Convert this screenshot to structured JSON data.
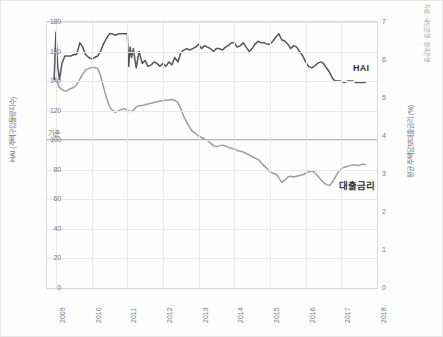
{
  "chart_data": {
    "type": "line",
    "title": "",
    "xlabel": "",
    "ylabel": "HAI (주택구입물량지수)",
    "ylabel_right": "평균 주택담보대출금리 (%)",
    "source_note": "자료 : 국민은행 · 한국은행",
    "grid": true,
    "legend_position": "inline-annotation",
    "xlim": [
      2008.75,
      2018.0
    ],
    "ylim": [
      0,
      180
    ],
    "ylim_right": [
      0,
      7
    ],
    "xticks": [
      "2009",
      "2010",
      "2011",
      "2012",
      "2013",
      "2014",
      "2015",
      "2016",
      "2017",
      "2018"
    ],
    "yticks_left": [
      "0",
      "20",
      "40",
      "60",
      "80",
      "100",
      "120",
      "140",
      "160",
      "180"
    ],
    "yticks_right": [
      "0",
      "1",
      "2",
      "3",
      "4",
      "5",
      "6",
      "7"
    ],
    "baseline": {
      "label": "기준",
      "value_left": 100,
      "value_right": 3.95,
      "color": "#6f6f6f"
    },
    "series": [
      {
        "name": "HAI",
        "axis": "left",
        "color": "#555555",
        "label": "HAI",
        "x": [
          2008.95,
          2009.0,
          2009.05,
          2009.1,
          2009.17,
          2009.25,
          2009.33,
          2009.42,
          2009.5,
          2009.58,
          2009.67,
          2009.75,
          2009.83,
          2009.92,
          2010.0,
          2010.08,
          2010.17,
          2010.25,
          2010.33,
          2010.42,
          2010.5,
          2010.58,
          2010.67,
          2010.75,
          2010.83,
          2010.92,
          2011.0,
          2011.04,
          2011.08,
          2011.12,
          2011.17,
          2011.25,
          2011.33,
          2011.42,
          2011.5,
          2011.58,
          2011.67,
          2011.75,
          2011.83,
          2011.92,
          2012.0,
          2012.08,
          2012.17,
          2012.25,
          2012.33,
          2012.42,
          2012.5,
          2012.58,
          2012.67,
          2012.75,
          2012.83,
          2012.92,
          2013.0,
          2013.08,
          2013.17,
          2013.25,
          2013.33,
          2013.42,
          2013.5,
          2013.58,
          2013.67,
          2013.75,
          2013.83,
          2013.92,
          2014.0,
          2014.08,
          2014.17,
          2014.25,
          2014.33,
          2014.42,
          2014.5,
          2014.58,
          2014.67,
          2014.75,
          2014.83,
          2014.92,
          2015.0,
          2015.08,
          2015.17,
          2015.25,
          2015.33,
          2015.42,
          2015.5,
          2015.58,
          2015.67,
          2015.75,
          2015.83,
          2015.92,
          2016.0,
          2016.08,
          2016.17,
          2016.25,
          2016.33,
          2016.42,
          2016.5,
          2016.58,
          2016.67,
          2016.75,
          2016.83,
          2016.92,
          2017.0,
          2017.08,
          2017.17,
          2017.25,
          2017.33,
          2017.42,
          2017.5,
          2017.58,
          2017.67
        ],
        "values": [
          141,
          173,
          150,
          141,
          152,
          157,
          157,
          157,
          158,
          158,
          166,
          163,
          158,
          156,
          155,
          156,
          157,
          160,
          165,
          169,
          172,
          172,
          171,
          172,
          172,
          172,
          172,
          150,
          163,
          156,
          162,
          149,
          160,
          152,
          154,
          150,
          151,
          153,
          152,
          150,
          152,
          150,
          153,
          151,
          156,
          153,
          159,
          161,
          162,
          161,
          162,
          163,
          165,
          162,
          164,
          163,
          162,
          160,
          162,
          162,
          161,
          163,
          164,
          166,
          166,
          163,
          164,
          166,
          163,
          160,
          162,
          165,
          167,
          166,
          166,
          165,
          165,
          167,
          170,
          172,
          168,
          167,
          165,
          162,
          164,
          163,
          160,
          157,
          153,
          150,
          149,
          150,
          152,
          153,
          152,
          149,
          146,
          142,
          140,
          140,
          140,
          139,
          140,
          140,
          140,
          139,
          139,
          139,
          139
        ]
      },
      {
        "name": "대출금리",
        "axis": "right",
        "color": "#9d9d9d",
        "label": "대출금리",
        "x": [
          2008.95,
          2009.0,
          2009.08,
          2009.17,
          2009.25,
          2009.33,
          2009.42,
          2009.5,
          2009.58,
          2009.67,
          2009.75,
          2009.83,
          2009.92,
          2010.0,
          2010.08,
          2010.17,
          2010.25,
          2010.33,
          2010.42,
          2010.5,
          2010.58,
          2010.67,
          2010.75,
          2010.83,
          2010.92,
          2011.0,
          2011.08,
          2011.17,
          2011.25,
          2011.33,
          2011.42,
          2011.5,
          2011.58,
          2011.67,
          2011.75,
          2011.83,
          2011.92,
          2012.0,
          2012.08,
          2012.17,
          2012.25,
          2012.33,
          2012.42,
          2012.5,
          2012.58,
          2012.67,
          2012.75,
          2012.83,
          2012.92,
          2013.0,
          2013.08,
          2013.17,
          2013.25,
          2013.33,
          2013.42,
          2013.5,
          2013.58,
          2013.67,
          2013.75,
          2013.83,
          2013.92,
          2014.0,
          2014.08,
          2014.17,
          2014.25,
          2014.33,
          2014.42,
          2014.5,
          2014.58,
          2014.67,
          2014.75,
          2014.83,
          2014.92,
          2015.0,
          2015.08,
          2015.17,
          2015.25,
          2015.33,
          2015.42,
          2015.5,
          2015.58,
          2015.67,
          2015.75,
          2015.83,
          2015.92,
          2016.0,
          2016.08,
          2016.17,
          2016.25,
          2016.33,
          2016.42,
          2016.5,
          2016.58,
          2016.67,
          2016.75,
          2016.83,
          2016.92,
          2017.0,
          2017.08,
          2017.17,
          2017.25,
          2017.33,
          2017.42,
          2017.5,
          2017.58,
          2017.67
        ],
        "values": [
          5.55,
          5.5,
          5.3,
          5.22,
          5.18,
          5.2,
          5.25,
          5.28,
          5.35,
          5.5,
          5.62,
          5.74,
          5.78,
          5.8,
          5.8,
          5.78,
          5.6,
          5.3,
          5.0,
          4.78,
          4.68,
          4.62,
          4.66,
          4.7,
          4.72,
          4.68,
          4.64,
          4.68,
          4.76,
          4.8,
          4.8,
          4.82,
          4.84,
          4.86,
          4.88,
          4.9,
          4.92,
          4.93,
          4.94,
          4.95,
          4.96,
          4.94,
          4.88,
          4.72,
          4.52,
          4.36,
          4.22,
          4.12,
          4.06,
          4.0,
          3.96,
          3.92,
          3.88,
          3.82,
          3.74,
          3.72,
          3.74,
          3.76,
          3.74,
          3.7,
          3.68,
          3.66,
          3.62,
          3.6,
          3.58,
          3.54,
          3.5,
          3.46,
          3.42,
          3.38,
          3.3,
          3.22,
          3.14,
          3.06,
          3.02,
          3.0,
          2.9,
          2.78,
          2.84,
          2.92,
          2.94,
          2.92,
          2.94,
          2.96,
          2.98,
          3.02,
          3.06,
          3.08,
          3.04,
          2.96,
          2.86,
          2.78,
          2.72,
          2.7,
          2.78,
          2.92,
          3.06,
          3.14,
          3.18,
          3.2,
          3.22,
          3.24,
          3.24,
          3.22,
          3.26,
          3.25
        ]
      }
    ]
  }
}
